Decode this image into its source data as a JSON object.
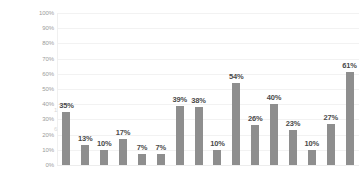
{
  "chart_data": {
    "type": "bar",
    "title": "",
    "subtitle": "",
    "xlabel": "",
    "ylabel": "",
    "ylim": [
      0,
      100
    ],
    "y_unit": "%",
    "grid": true,
    "legend": "none",
    "orientation": "vertical",
    "bar_color": "#8e8e8e",
    "background_color": "#ffffff",
    "gridline_color": "#f2f2f2",
    "axis_label_color": "#9b9b9b",
    "data_label_color": "#4a4a4a",
    "categories": [
      "1",
      "2",
      "3",
      "4",
      "5",
      "6",
      "7",
      "8",
      "9",
      "10",
      "11",
      "12",
      "13",
      "14",
      "15",
      "16"
    ],
    "x_tick_labels": [],
    "values": [
      35,
      13,
      10,
      17,
      7,
      7,
      39,
      38,
      10,
      54,
      26,
      40,
      23,
      10,
      27,
      61
    ],
    "data_labels": [
      "35%",
      "13%",
      "10%",
      "17%",
      "7%",
      "7%",
      "39%",
      "38%",
      "10%",
      "54%",
      "26%",
      "40%",
      "23%",
      "10%",
      "27%",
      "61%"
    ],
    "y_ticks": [
      0,
      10,
      20,
      30,
      40,
      50,
      60,
      70,
      80,
      90,
      100
    ],
    "y_tick_labels": [
      "0%",
      "10%",
      "20%",
      "30%",
      "40%",
      "50%",
      "60%",
      "70%",
      "80%",
      "90%",
      "100%"
    ]
  },
  "artifacts": {
    "mark_top": "1",
    "mark_bottom": "6"
  }
}
